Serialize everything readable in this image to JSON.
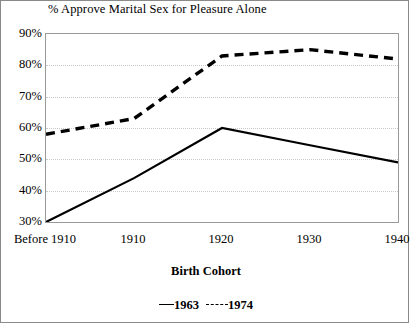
{
  "chart_data": {
    "type": "line",
    "title": "% Approve Marital Sex for Pleasure Alone",
    "xlabel": "Birth Cohort",
    "ylabel": "",
    "categories": [
      "Before 1910",
      "1910",
      "1920",
      "1930",
      "1940"
    ],
    "ylim": [
      30,
      90
    ],
    "yticks": [
      30,
      40,
      50,
      60,
      70,
      80,
      90
    ],
    "yticklabels": [
      "30%",
      "40%",
      "50%",
      "60%",
      "70%",
      "80%",
      "90%"
    ],
    "grid": true,
    "legend_position": "bottom",
    "series": [
      {
        "name": "1963",
        "style": "solid",
        "color": "#000000",
        "values": [
          30,
          44,
          60,
          54.5,
          49
        ]
      },
      {
        "name": "1974",
        "style": "dashed",
        "color": "#000000",
        "values": [
          58,
          63,
          83,
          85,
          82
        ]
      }
    ]
  },
  "legend": {
    "solid_label": "1963",
    "dashed_label": "1974"
  }
}
